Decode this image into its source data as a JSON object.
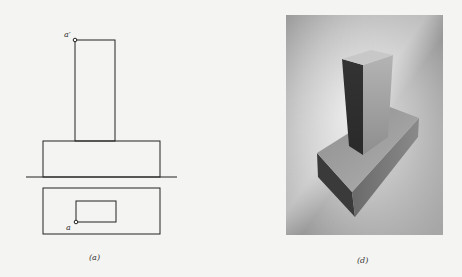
{
  "figure": {
    "left_panel": {
      "caption": "(a)",
      "title": "Orthographic projection (front and top views)",
      "labels": {
        "front_point": "a′",
        "top_point": "a"
      }
    },
    "right_panel": {
      "caption": "(d)",
      "title": "Shaded 3D view of stepped block"
    }
  },
  "colors": {
    "background": "#f4f4f2",
    "line": "#222222",
    "top_face": "#c9c9c9",
    "dark_face": "#4a4a4a",
    "light_face": "#a6a6a6"
  }
}
